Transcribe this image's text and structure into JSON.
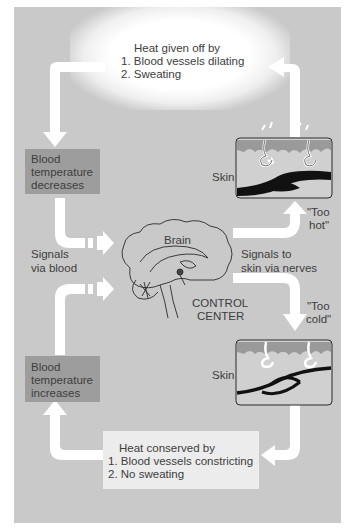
{
  "diagram": {
    "heat_loss": {
      "heading": "Heat given off by",
      "items": [
        "1.  Blood vessels dilating",
        "2.  Sweating"
      ]
    },
    "heat_conserve": {
      "heading": "Heat conserved by",
      "items": [
        "1.  Blood vessels constricting",
        "2.  No sweating"
      ]
    },
    "blood_decreases": [
      "Blood",
      "temperature",
      "decreases"
    ],
    "blood_increases": [
      "Blood",
      "temperature",
      "increases"
    ],
    "signals_blood": [
      "Signals",
      "via blood"
    ],
    "signals_nerves": [
      "Signals to",
      "skin via nerves"
    ],
    "brain_label": "Brain",
    "control_center": [
      "CONTROL",
      "CENTER"
    ],
    "too_hot": [
      "\"Too",
      "hot\""
    ],
    "too_cold": [
      "\"Too",
      "cold\""
    ],
    "skin_top_label": "Skin",
    "skin_bottom_label": "Skin",
    "colors": {
      "background": "#c9c9c9",
      "box": "#9d9d9d",
      "arrow": "#ffffff",
      "vessel": "#111111",
      "epidermis": "#9a9a9a"
    }
  }
}
